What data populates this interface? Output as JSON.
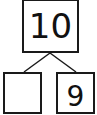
{
  "number_bond": {
    "whole": "10",
    "parts": [
      {
        "position": "left",
        "value": ""
      },
      {
        "position": "right",
        "value": "9"
      }
    ]
  },
  "colors": {
    "stroke": "#1a1a1a",
    "background": "#ffffff"
  }
}
